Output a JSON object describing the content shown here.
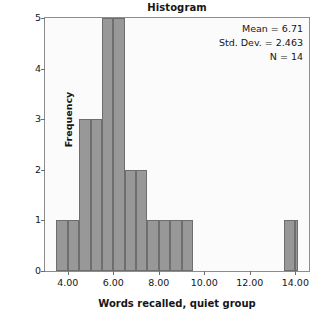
{
  "chart_data": {
    "type": "bar",
    "title": "Histogram",
    "xlabel": "Words recalled, quiet group",
    "ylabel": "Frequency",
    "xlim": [
      3.0,
      14.6
    ],
    "ylim": [
      0,
      5
    ],
    "grid": false,
    "legend": "none",
    "bin_width": 0.5,
    "x_ticks": [
      "4.00",
      "6.00",
      "8.00",
      "10.00",
      "12.00",
      "14.00"
    ],
    "x_tick_values": [
      4,
      6,
      8,
      10,
      12,
      14
    ],
    "y_ticks": [
      "0",
      "1",
      "2",
      "3",
      "4",
      "5"
    ],
    "y_tick_values": [
      0,
      1,
      2,
      3,
      4,
      5
    ],
    "bars": [
      {
        "bin_start": 3.5,
        "bin_end": 4.0,
        "value": 1
      },
      {
        "bin_start": 4.0,
        "bin_end": 4.5,
        "value": 1
      },
      {
        "bin_start": 4.5,
        "bin_end": 5.0,
        "value": 3
      },
      {
        "bin_start": 5.0,
        "bin_end": 5.5,
        "value": 3
      },
      {
        "bin_start": 5.5,
        "bin_end": 6.0,
        "value": 5
      },
      {
        "bin_start": 6.0,
        "bin_end": 6.5,
        "value": 5
      },
      {
        "bin_start": 6.5,
        "bin_end": 7.0,
        "value": 2
      },
      {
        "bin_start": 7.0,
        "bin_end": 7.5,
        "value": 2
      },
      {
        "bin_start": 7.5,
        "bin_end": 8.0,
        "value": 1
      },
      {
        "bin_start": 8.0,
        "bin_end": 8.5,
        "value": 1
      },
      {
        "bin_start": 8.5,
        "bin_end": 9.0,
        "value": 1
      },
      {
        "bin_start": 9.0,
        "bin_end": 9.5,
        "value": 1
      },
      {
        "bin_start": 13.5,
        "bin_end": 14.0,
        "value": 1
      },
      {
        "bin_start": 14.0,
        "bin_end": 14.1,
        "value": 1
      }
    ],
    "categories": [
      "3.5-4.5",
      "4.5-5.5",
      "5.5-6.5",
      "6.5-7.5",
      "7.5-8.5",
      "8.5-9.5",
      "13.5-14.5"
    ],
    "values": [
      1,
      3,
      5,
      2,
      1,
      1,
      1
    ],
    "annotations": {
      "mean": "Mean = 6.71",
      "std_dev": "Std. Dev. = 2.463",
      "n": "N = 14"
    }
  },
  "colors": {
    "bar_fill": "#989898",
    "bar_border": "#6e6e6e",
    "plot_background": "#fbfbfb",
    "frame_border": "#8d8d8d",
    "text": "#161616",
    "page_background": "#ffffff"
  }
}
